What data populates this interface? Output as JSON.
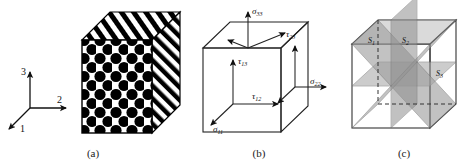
{
  "figure": {
    "kind": "composite-material-failure-figure",
    "panels": [
      {
        "id": "a",
        "caption": "(a)",
        "name": "unidirectional-fiber-composite-cube",
        "axes": {
          "labels": [
            "1",
            "2",
            "3"
          ],
          "axis_1": "1",
          "axis_2": "2",
          "axis_3": "3"
        },
        "front_face": "hexagonally-packed-black-fiber-circles",
        "top_face": "diagonal-black-white-stripes",
        "side_face": "diagonal-black-white-stripes"
      },
      {
        "id": "b",
        "caption": "(b)",
        "name": "stress-state-cube",
        "stresses": [
          {
            "symbol": "σ",
            "sub": "33",
            "label": "σ33"
          },
          {
            "symbol": "τ",
            "sub": "23",
            "label": "τ23"
          },
          {
            "symbol": "τ",
            "sub": "13",
            "label": "τ13"
          },
          {
            "symbol": "τ",
            "sub": "12",
            "label": "τ12"
          },
          {
            "symbol": "σ",
            "sub": "22",
            "label": "σ22"
          },
          {
            "symbol": "σ",
            "sub": "11",
            "label": "σ11"
          }
        ]
      },
      {
        "id": "c",
        "caption": "(c)",
        "name": "failure-plane-cube",
        "planes": [
          {
            "symbol": "S",
            "sub": "1",
            "label": "S1"
          },
          {
            "symbol": "S",
            "sub": "2",
            "label": "S2"
          },
          {
            "symbol": "S",
            "sub": "3",
            "label": "S3"
          }
        ]
      }
    ],
    "colors": {
      "ink": "#111111",
      "fiber": "#000000",
      "matrix": "#ffffff",
      "plane_light": "#b9b9b9",
      "plane_mid": "#a2a2a2",
      "plane_dark": "#8a8a8a",
      "plane_darkest": "#767676",
      "outline": "#333333"
    }
  }
}
